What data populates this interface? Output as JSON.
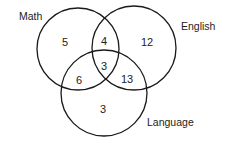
{
  "diagram": {
    "type": "venn-3",
    "stroke_color": "#1a1a1a",
    "text_color": "#222222",
    "sets": [
      {
        "id": "math",
        "label": "Math",
        "cx": 78,
        "cy": 49,
        "r": 41,
        "label_x": 19,
        "label_y": 20
      },
      {
        "id": "english",
        "label": "English",
        "cx": 134,
        "cy": 48,
        "r": 42,
        "label_x": 181,
        "label_y": 30
      },
      {
        "id": "language",
        "label": "Language",
        "cx": 104,
        "cy": 93,
        "r": 43,
        "label_x": 147,
        "label_y": 126
      }
    ],
    "regions": {
      "math_only": {
        "value": "5",
        "x": 65,
        "y": 42
      },
      "math_english": {
        "value": "4",
        "x": 104,
        "y": 41
      },
      "english_only": {
        "value": "12",
        "x": 147,
        "y": 42
      },
      "all_three": {
        "value": "3",
        "x": 104,
        "y": 66
      },
      "math_language": {
        "value": "6",
        "x": 79,
        "y": 80
      },
      "english_language": {
        "value": "13",
        "x": 127,
        "y": 79
      },
      "language_only": {
        "value": "3",
        "x": 103,
        "y": 109
      }
    }
  }
}
